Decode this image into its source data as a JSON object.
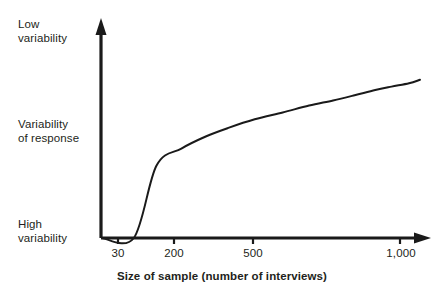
{
  "chart_data": {
    "type": "line",
    "title": "",
    "subtitle": "",
    "xlabel": "Size of sample (number of interviews)",
    "ylabel": "Variability of response",
    "grid": false,
    "legend": "none",
    "annotations": [],
    "x_axis": {
      "tick_labels": [
        "30",
        "200",
        "500",
        "1,000"
      ],
      "tick_values": [
        30,
        200,
        500,
        1000
      ],
      "scale": "logarithmic",
      "arrow": true,
      "xlim": [
        20,
        1150
      ]
    },
    "y_axis": {
      "tick_labels": [
        "High variability",
        "Variability of response",
        "Low variability"
      ],
      "category_labels_bottom_to_top": [
        "High variability",
        "Variability of response",
        "Low variability"
      ],
      "arrow": true,
      "ylim": [
        0,
        1
      ],
      "numeric_ticks": false
    },
    "series": [
      {
        "name": "Variability of response vs sample size",
        "x": [
          30,
          40,
          55,
          75,
          100,
          140,
          200,
          280,
          380,
          500,
          650,
          800,
          1000,
          1150
        ],
        "y": [
          0.0,
          0.42,
          0.52,
          0.59,
          0.64,
          0.69,
          0.73,
          0.77,
          0.8,
          0.83,
          0.86,
          0.88,
          0.9,
          0.92
        ],
        "color": "#1a1a1a",
        "line_width": 2,
        "marker": "none",
        "description": "Variability of response decreases (curve rises toward low variability) sharply at first, then flattens as sample size grows."
      }
    ]
  },
  "labels": {
    "y_low": "Low\nvariability",
    "y_mid": "Variability\nof response",
    "y_high": "High\nvariability",
    "x_title": "Size of sample (number of interviews)",
    "x_ticks": [
      "30",
      "200",
      "500",
      "1,000"
    ]
  },
  "colors": {
    "background": "#ffffff",
    "ink": "#231f20",
    "curve": "#1a1a1a",
    "axis": "#1a1a1a"
  }
}
